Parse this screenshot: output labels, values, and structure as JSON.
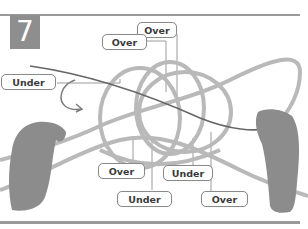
{
  "step": {
    "number": "7"
  },
  "labels": [
    {
      "id": "over-top-right",
      "text": "Over"
    },
    {
      "id": "over-top-left",
      "text": "Over"
    },
    {
      "id": "under-left",
      "text": "Under"
    },
    {
      "id": "over-bottom-left",
      "text": "Over"
    },
    {
      "id": "under-bottom-middle",
      "text": "Under"
    },
    {
      "id": "under-bottom-left",
      "text": "Under"
    },
    {
      "id": "over-bottom-right",
      "text": "Over"
    }
  ],
  "colors": {
    "rope": "#b9b9b9",
    "working_line": "#666666",
    "badge": "#8e8e8e",
    "hand": "#8c8c8c",
    "label_border": "#8a8a8a"
  }
}
